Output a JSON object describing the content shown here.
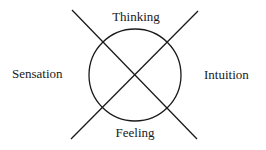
{
  "diagram": {
    "labels": {
      "top": "Thinking",
      "bottom": "Feeling",
      "left": "Sensation",
      "right": "Intuition"
    },
    "colors": {
      "stroke": "#1a1a1a",
      "background": "#ffffff"
    }
  }
}
